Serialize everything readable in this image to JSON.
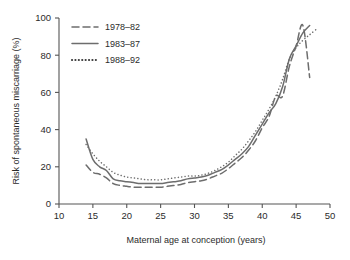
{
  "chart_data": {
    "type": "line",
    "title": "",
    "xlabel": "Maternal age at conception (years)",
    "ylabel": "Risk of spontaneous miscarriage (%)",
    "xlim": [
      10,
      50
    ],
    "ylim": [
      0,
      100
    ],
    "xticks": [
      10,
      15,
      20,
      25,
      30,
      35,
      40,
      45,
      50
    ],
    "yticks": [
      0,
      20,
      40,
      60,
      80,
      100
    ],
    "grid": false,
    "legend_position": "top-left",
    "series": [
      {
        "name": "1978–82",
        "style": "dashed",
        "color": "#6d6d6d",
        "x": [
          14,
          15,
          16,
          17,
          18,
          19,
          20,
          21,
          22,
          23,
          24,
          25,
          26,
          27,
          28,
          29,
          30,
          31,
          32,
          33,
          34,
          35,
          36,
          37,
          38,
          39,
          40,
          41,
          42,
          43,
          44,
          45,
          46,
          47
        ],
        "values": [
          21,
          17,
          16,
          14,
          11,
          10,
          9.5,
          9,
          9,
          9,
          9,
          9,
          9.5,
          10,
          10.5,
          11.5,
          12,
          12.5,
          13.5,
          15,
          16.5,
          19,
          22,
          25,
          29,
          34,
          41,
          47,
          58,
          58,
          74,
          85,
          96,
          68
        ]
      },
      {
        "name": "1983–87",
        "style": "solid",
        "color": "#6d6d6d",
        "x": [
          14,
          15,
          16,
          17,
          18,
          19,
          20,
          21,
          22,
          23,
          24,
          25,
          26,
          27,
          28,
          29,
          30,
          31,
          32,
          33,
          34,
          35,
          36,
          37,
          38,
          39,
          40,
          41,
          42,
          43,
          44,
          45,
          46,
          47
        ],
        "values": [
          35,
          24,
          20,
          18,
          13.5,
          12.5,
          12,
          11.5,
          11,
          11,
          11,
          11,
          11.5,
          12,
          12.5,
          13.5,
          14,
          14.5,
          15.5,
          17,
          18.5,
          21,
          24,
          27,
          31,
          37,
          43,
          49,
          54,
          63,
          78,
          85,
          92,
          96
        ]
      },
      {
        "name": "1988–92",
        "style": "dotted",
        "color": "#3a3a3a",
        "x": [
          14,
          15,
          16,
          17,
          18,
          19,
          20,
          21,
          22,
          23,
          24,
          25,
          26,
          27,
          28,
          29,
          30,
          31,
          32,
          33,
          34,
          35,
          36,
          37,
          38,
          39,
          40,
          41,
          42,
          43,
          44,
          45,
          46,
          47,
          48
        ],
        "values": [
          32,
          27,
          23,
          20,
          17,
          15.5,
          14.5,
          14,
          13.5,
          13,
          13,
          13,
          13.5,
          14,
          14.5,
          15,
          15,
          15.5,
          16.5,
          18,
          20,
          22.5,
          26,
          29.5,
          34,
          39,
          45,
          51,
          58,
          67,
          78,
          84,
          88,
          91,
          94
        ]
      }
    ]
  },
  "legend": {
    "items": [
      {
        "label": "1978–82",
        "style": "dashed"
      },
      {
        "label": "1983–87",
        "style": "solid"
      },
      {
        "label": "1988–92",
        "style": "dotted"
      }
    ]
  },
  "axes": {
    "x_title": "Maternal age at conception (years)",
    "y_title": "Risk of spontaneous miscarriage (%)",
    "x_tick_labels": [
      "10",
      "15",
      "20",
      "25",
      "30",
      "35",
      "40",
      "45",
      "50"
    ],
    "y_tick_labels": [
      "0",
      "20",
      "40",
      "60",
      "80",
      "100"
    ]
  },
  "colors": {
    "axis": "#555555",
    "line_light": "#6d6d6d",
    "line_dark": "#3a3a3a",
    "text": "#2b2b2b",
    "background": "#ffffff"
  }
}
